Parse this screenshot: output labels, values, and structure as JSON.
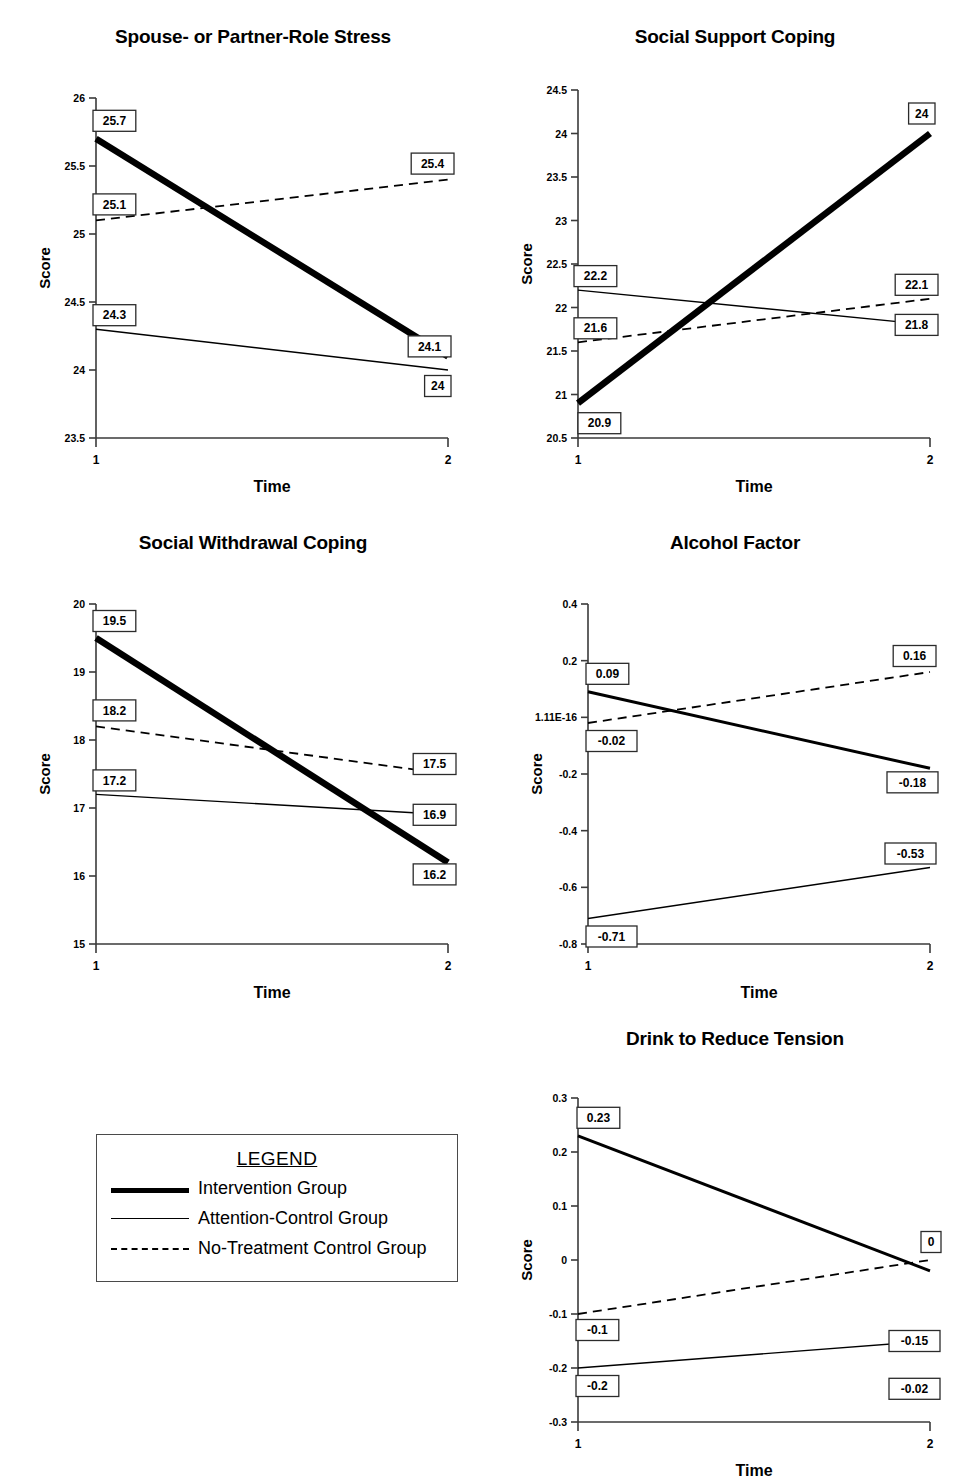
{
  "figure": {
    "xlabel": "Time",
    "ylabel": "Score",
    "x_categories": [
      "1",
      "2"
    ]
  },
  "legend": {
    "title": "LEGEND",
    "entries": [
      {
        "label": "Intervention Group",
        "style": "thick-solid"
      },
      {
        "label": "Attention-Control Group",
        "style": "thin-solid"
      },
      {
        "label": "No-Treatment Control Group",
        "style": "dashed"
      }
    ]
  },
  "chart_data": [
    {
      "type": "line",
      "title": "Spouse- or Partner-Role Stress",
      "xlabel": "Time",
      "ylabel": "Score",
      "x": [
        "1",
        "2"
      ],
      "ylim": [
        23.5,
        26
      ],
      "yticks": [
        26,
        25.5,
        25,
        24.5,
        24,
        23.5
      ],
      "ytick_labels": [
        "26",
        "25.5",
        "25",
        "24.5",
        "24",
        "23.5"
      ],
      "grid": false,
      "legend_position": "external",
      "series": [
        {
          "name": "Intervention Group",
          "style": "thick-solid",
          "values": [
            25.7,
            24.1
          ],
          "labels": [
            "25.7",
            "24.1"
          ]
        },
        {
          "name": "Attention-Control Group",
          "style": "thin-solid",
          "values": [
            24.3,
            24
          ],
          "labels": [
            "24.3",
            "24"
          ]
        },
        {
          "name": "No-Treatment Control Group",
          "style": "dashed",
          "values": [
            25.1,
            25.4
          ],
          "labels": [
            "25.1",
            "25.4"
          ]
        }
      ]
    },
    {
      "type": "line",
      "title": "Social Support Coping",
      "xlabel": "Time",
      "ylabel": "Score",
      "x": [
        "1",
        "2"
      ],
      "ylim": [
        20.5,
        24.5
      ],
      "yticks": [
        24.5,
        24,
        23.5,
        23,
        22.5,
        22,
        21.5,
        21,
        20.5
      ],
      "ytick_labels": [
        "24.5",
        "24",
        "23.5",
        "23",
        "22.5",
        "22",
        "21.5",
        "21",
        "20.5"
      ],
      "grid": false,
      "legend_position": "external",
      "series": [
        {
          "name": "Intervention Group",
          "style": "thick-solid",
          "values": [
            20.9,
            24
          ],
          "labels": [
            "20.9",
            "24"
          ]
        },
        {
          "name": "Attention-Control Group",
          "style": "thin-solid",
          "values": [
            22.2,
            21.8
          ],
          "labels": [
            "22.2",
            "21.8"
          ]
        },
        {
          "name": "No-Treatment Control Group",
          "style": "dashed",
          "values": [
            21.6,
            22.1
          ],
          "labels": [
            "21.6",
            "22.1"
          ]
        }
      ]
    },
    {
      "type": "line",
      "title": "Social Withdrawal Coping",
      "xlabel": "Time",
      "ylabel": "Score",
      "x": [
        "1",
        "2"
      ],
      "ylim": [
        15,
        20
      ],
      "yticks": [
        20,
        19,
        18,
        17,
        16,
        15
      ],
      "ytick_labels": [
        "20",
        "19",
        "18",
        "17",
        "16",
        "15"
      ],
      "grid": false,
      "legend_position": "external",
      "series": [
        {
          "name": "Intervention Group",
          "style": "thick-solid",
          "values": [
            19.5,
            16.2
          ],
          "labels": [
            "19.5",
            "16.2"
          ]
        },
        {
          "name": "Attention-Control Group",
          "style": "thin-solid",
          "values": [
            17.2,
            16.9
          ],
          "labels": [
            "17.2",
            "16.9"
          ]
        },
        {
          "name": "No-Treatment Control Group",
          "style": "dashed",
          "values": [
            18.2,
            17.5
          ],
          "labels": [
            "18.2",
            "17.5"
          ]
        }
      ]
    },
    {
      "type": "line",
      "title": "Alcohol Factor",
      "xlabel": "Time",
      "ylabel": "Score",
      "x": [
        "1",
        "2"
      ],
      "ylim": [
        -0.8,
        0.4
      ],
      "yticks": [
        0.4,
        0.2,
        0,
        -0.2,
        -0.4,
        -0.6,
        -0.8
      ],
      "ytick_labels": [
        "0.4",
        "0.2",
        "1.11E-16",
        "-0.2",
        "-0.4",
        "-0.6",
        "-0.8"
      ],
      "grid": false,
      "legend_position": "external",
      "series": [
        {
          "name": "Intervention Group",
          "style": "medium-solid",
          "values": [
            0.09,
            -0.18
          ],
          "labels": [
            "0.09",
            "-0.18"
          ]
        },
        {
          "name": "Attention-Control Group",
          "style": "thin-solid",
          "values": [
            -0.71,
            -0.53
          ],
          "labels": [
            "-0.71",
            "-0.53"
          ]
        },
        {
          "name": "No-Treatment Control Group",
          "style": "dashed",
          "values": [
            -0.02,
            0.16
          ],
          "labels": [
            "-0.02",
            "0.16"
          ]
        }
      ]
    },
    {
      "type": "line",
      "title": "Drink to Reduce Tension",
      "xlabel": "Time",
      "ylabel": "Score",
      "x": [
        "1",
        "2"
      ],
      "ylim": [
        -0.3,
        0.3
      ],
      "yticks": [
        0.3,
        0.2,
        0.1,
        0,
        -0.1,
        -0.2,
        -0.3
      ],
      "ytick_labels": [
        "0.3",
        "0.2",
        "0.1",
        "0",
        "-0.1",
        "-0.2",
        "-0.3"
      ],
      "grid": false,
      "legend_position": "external",
      "series": [
        {
          "name": "Intervention Group",
          "style": "medium-solid",
          "values": [
            0.23,
            -0.02
          ],
          "labels": [
            "0.23",
            "-0.02"
          ]
        },
        {
          "name": "Attention-Control Group",
          "style": "thin-solid",
          "values": [
            -0.2,
            -0.15
          ],
          "labels": [
            "-0.2",
            "-0.15"
          ]
        },
        {
          "name": "No-Treatment Control Group",
          "style": "dashed",
          "values": [
            -0.1,
            0
          ],
          "labels": [
            "-0.1",
            "0"
          ]
        }
      ]
    }
  ]
}
